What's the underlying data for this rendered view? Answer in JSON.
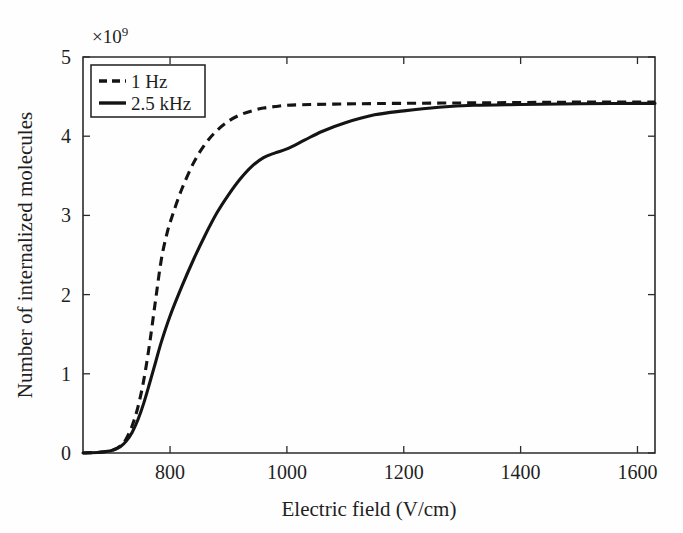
{
  "figure": {
    "background": "#fefefe",
    "ink_color": "#141414"
  },
  "chart_data": {
    "type": "line",
    "title": "",
    "subtitle": "",
    "xlabel": "Electric field (V/cm)",
    "ylabel": "Number of internalized molecules",
    "y_exponent_label": "×10",
    "y_exponent_power": "9",
    "y_scale_factor": 1000000000,
    "xlim": [
      651,
      1630
    ],
    "ylim": [
      0,
      5
    ],
    "xticks": [
      800,
      1000,
      1200,
      1400,
      1600
    ],
    "xticklabels": [
      "800",
      "1000",
      "1200",
      "1400",
      "1600"
    ],
    "yticks": [
      0,
      1,
      2,
      3,
      4,
      5
    ],
    "yticklabels": [
      "0",
      "1",
      "2",
      "3",
      "4",
      "5"
    ],
    "grid": false,
    "legend_position": "upper-left-inside",
    "series": [
      {
        "name": "1 Hz",
        "style": "dashed",
        "color": "#141414",
        "x": [
          651,
          680,
          700,
          715,
          725,
          735,
          745,
          755,
          765,
          775,
          785,
          795,
          805,
          820,
          840,
          860,
          880,
          900,
          920,
          940,
          960,
          980,
          1000,
          1040,
          1080,
          1120,
          1200,
          1300,
          1400,
          1500,
          1630
        ],
        "y": [
          0.0,
          0.01,
          0.03,
          0.09,
          0.18,
          0.34,
          0.58,
          0.92,
          1.38,
          1.92,
          2.44,
          2.78,
          3.02,
          3.33,
          3.66,
          3.9,
          4.07,
          4.19,
          4.27,
          4.32,
          4.355,
          4.375,
          4.39,
          4.4,
          4.405,
          4.41,
          4.415,
          4.42,
          4.425,
          4.43,
          4.43
        ]
      },
      {
        "name": "2.5 kHz",
        "style": "solid",
        "color": "#141414",
        "x": [
          651,
          680,
          700,
          715,
          725,
          735,
          745,
          755,
          765,
          775,
          785,
          800,
          820,
          840,
          860,
          880,
          900,
          920,
          940,
          960,
          980,
          1000,
          1030,
          1060,
          1100,
          1150,
          1200,
          1260,
          1320,
          1400,
          1500,
          1630
        ],
        "y": [
          0.0,
          0.01,
          0.03,
          0.08,
          0.15,
          0.26,
          0.42,
          0.63,
          0.88,
          1.14,
          1.4,
          1.73,
          2.1,
          2.44,
          2.75,
          3.03,
          3.26,
          3.46,
          3.62,
          3.73,
          3.79,
          3.84,
          3.95,
          4.06,
          4.17,
          4.27,
          4.32,
          4.365,
          4.39,
          4.4,
          4.41,
          4.415
        ]
      }
    ],
    "legend_entries": [
      {
        "label": "1 Hz",
        "style": "dashed"
      },
      {
        "label": "2.5 kHz",
        "style": "solid"
      }
    ]
  }
}
